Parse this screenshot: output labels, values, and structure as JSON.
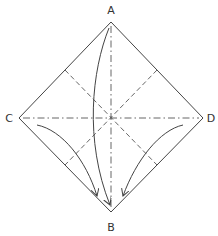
{
  "diagram": {
    "type": "origami-fold-diagram",
    "labels": {
      "A": "A",
      "B": "B",
      "C": "C",
      "D": "D"
    },
    "colors": {
      "line": "#444444",
      "background": "#ffffff"
    },
    "elements": [
      {
        "kind": "square-outline",
        "style": "solid",
        "description": "square rotated 45° with corners A (top), D (right), B (bottom), C (left)"
      },
      {
        "kind": "fold-line",
        "style": "dash-dot (mountain)",
        "from": "A",
        "to": "B",
        "description": "vertical diagonal"
      },
      {
        "kind": "fold-line",
        "style": "dash-dot (mountain)",
        "from": "C",
        "to": "D",
        "description": "horizontal diagonal"
      },
      {
        "kind": "fold-line",
        "style": "dashed (valley)",
        "description": "line between midpoints of edges AC and DB"
      },
      {
        "kind": "fold-line",
        "style": "dashed (valley)",
        "description": "line between midpoints of edges AD and CB"
      },
      {
        "kind": "arrow",
        "from": "A",
        "to": "B",
        "description": "curved arrow from A down to B"
      },
      {
        "kind": "arrow",
        "from": "C",
        "to": "B",
        "description": "curved arrow from near C down to B"
      },
      {
        "kind": "arrow",
        "from": "D",
        "to": "B",
        "description": "curved arrow from near D down to B"
      }
    ]
  }
}
